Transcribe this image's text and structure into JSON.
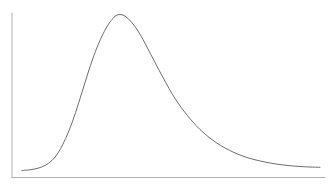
{
  "figure": {
    "name": "skewed-distribution-curve",
    "background_color": "#ffffff",
    "width": 334,
    "height": 186
  },
  "axes": {
    "color": "#b0b0b0",
    "line_width": 1,
    "y_axis": {
      "x": 12,
      "y_top": 13,
      "y_bottom": 177.5
    },
    "x_axis": {
      "y": 177.5,
      "x_left": 12,
      "x_right": 325
    },
    "ticks": false,
    "tick_labels": false,
    "grid": false,
    "frame": "left-bottom"
  },
  "curve": {
    "color": "#6e6e6e",
    "line_width": 1,
    "fill": "none",
    "style": "solid",
    "shape": "right-skewed-unimodal"
  },
  "chart_data": {
    "type": "line",
    "title": "",
    "subtitle": "",
    "xlabel": "",
    "ylabel": "",
    "legend": null,
    "legend_position": "none",
    "grid": false,
    "annotations": [],
    "xlim": [
      0,
      334
    ],
    "ylim": [
      0,
      186
    ],
    "axis_tick_labels": {
      "x": [],
      "y": []
    },
    "series": [
      {
        "name": "density",
        "points_px": [
          [
            22,
            170.5
          ],
          [
            30,
            169.8
          ],
          [
            38,
            168.2
          ],
          [
            45,
            165.5
          ],
          [
            52,
            160.5
          ],
          [
            58,
            153.0
          ],
          [
            63,
            144.0
          ],
          [
            68,
            133.0
          ],
          [
            73,
            120.0
          ],
          [
            78,
            105.0
          ],
          [
            83,
            89.0
          ],
          [
            88,
            73.0
          ],
          [
            93,
            58.0
          ],
          [
            98,
            45.0
          ],
          [
            103,
            34.0
          ],
          [
            108,
            25.0
          ],
          [
            112,
            19.5
          ],
          [
            116,
            15.5
          ],
          [
            120,
            14.5
          ],
          [
            124,
            15.5
          ],
          [
            128,
            18.5
          ],
          [
            133,
            24.0
          ],
          [
            138,
            31.0
          ],
          [
            143,
            39.5
          ],
          [
            148,
            49.0
          ],
          [
            154,
            60.5
          ],
          [
            160,
            72.0
          ],
          [
            166,
            83.0
          ],
          [
            172,
            93.5
          ],
          [
            178,
            103.0
          ],
          [
            185,
            112.5
          ],
          [
            192,
            121.0
          ],
          [
            200,
            129.5
          ],
          [
            208,
            136.5
          ],
          [
            216,
            142.5
          ],
          [
            225,
            148.0
          ],
          [
            234,
            152.5
          ],
          [
            244,
            156.5
          ],
          [
            254,
            159.5
          ],
          [
            265,
            162.0
          ],
          [
            276,
            164.0
          ],
          [
            288,
            165.5
          ],
          [
            300,
            166.5
          ],
          [
            310,
            167.0
          ],
          [
            320,
            167.3
          ]
        ]
      }
    ]
  }
}
